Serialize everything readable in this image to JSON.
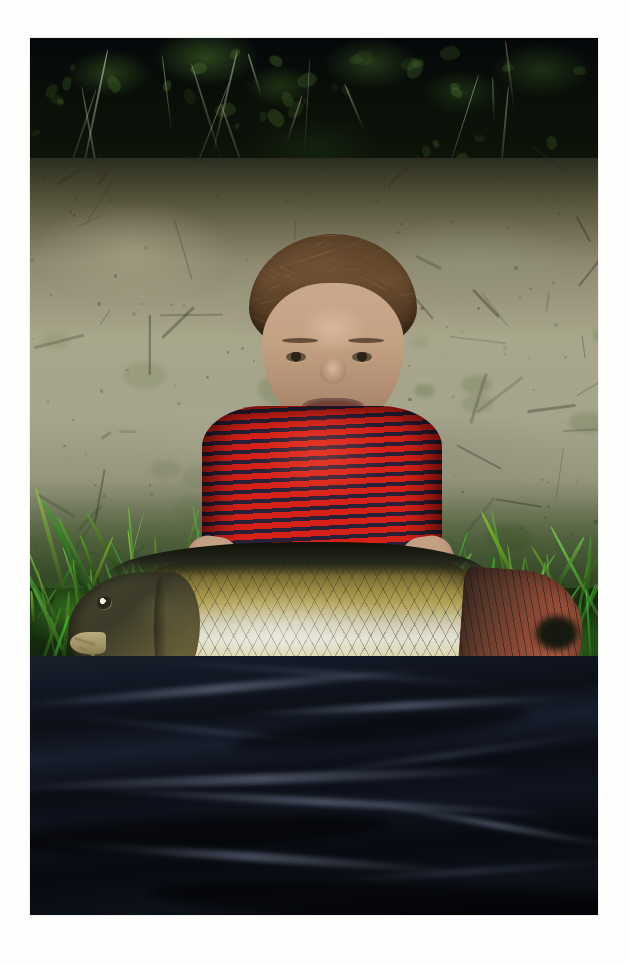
{
  "page": {
    "background_color": "#fefefc",
    "margin_px": 30
  },
  "photo": {
    "caption": "Young boy kneeling on a riverbank holding a large common carp",
    "subject": "common-carp-and-boy",
    "width": 568,
    "height": 877,
    "offset_x": 30,
    "offset_y": 38,
    "palette": {
      "foliage_dark": "#0a0f08",
      "clay_bank": "#a8a68b",
      "grass_green": "#3e8a28",
      "shirt_red": "#d62118",
      "shirt_stripe": "#2a2038",
      "skin": "#c4a183",
      "hair_brown": "#5b4128",
      "fish_dorsal": "#1c1d14",
      "fish_gold": "#b5a55a",
      "fish_belly": "#e3e2d4",
      "tail_red": "#a85a40",
      "tarp_black": "#0c1018"
    }
  },
  "scene": {
    "bands": [
      {
        "name": "foliage",
        "label": "dark shaded hedgerow foliage"
      },
      {
        "name": "bank",
        "label": "dry cracked clay riverbank"
      },
      {
        "name": "grass",
        "label": "bright green grass strip"
      },
      {
        "name": "tarp",
        "label": "black plastic unhooking mat"
      }
    ],
    "boy": {
      "label": "smiling boy in red striped t-shirt",
      "hair": "short brown hair",
      "shirt": "red t-shirt with dark horizontal stripes",
      "pose": "kneeling, both hands supporting the fish"
    },
    "fish": {
      "label": "common carp",
      "head": "dark olive head with barbels",
      "body": "diamond scale lattice, golden-olive back and pale silver belly",
      "tail": "reddish-brown caudal fin",
      "fins": [
        "pectoral-fin",
        "pelvic-fin"
      ]
    }
  }
}
